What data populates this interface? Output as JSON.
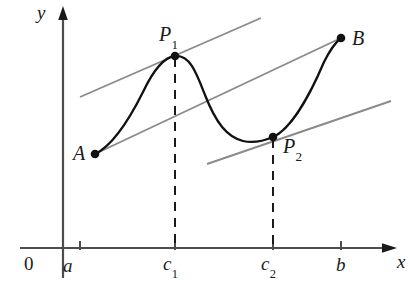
{
  "figure": {
    "axes": {
      "x_label": "x",
      "y_label": "y",
      "origin_label": "0",
      "x_axis_color": "#4d4d4d",
      "y_axis_color": "#4d4d4d"
    },
    "x_ticks": [
      {
        "name": "a",
        "label": "a",
        "sub": "",
        "x": 80
      },
      {
        "name": "c1",
        "label": "c",
        "sub": "1",
        "x": 175
      },
      {
        "name": "c2",
        "label": "c",
        "sub": "2",
        "x": 273
      },
      {
        "name": "b",
        "label": "b",
        "sub": "",
        "x": 341
      }
    ],
    "points": [
      {
        "name": "A",
        "label": "A",
        "sub": "",
        "x": 95,
        "y": 154
      },
      {
        "name": "P1",
        "label": "P",
        "sub": "1",
        "x": 175,
        "y": 56
      },
      {
        "name": "P2",
        "label": "P",
        "sub": "2",
        "x": 273,
        "y": 137
      },
      {
        "name": "B",
        "label": "B",
        "sub": "",
        "x": 341,
        "y": 38
      }
    ],
    "curve": {
      "description": "smooth curve from A rising to local maximum P1, falling to local minimum P2, then rising to B",
      "color": "#111111",
      "stroke_width": 2.2
    },
    "lines": [
      {
        "name": "tangent-at-P1",
        "style": "solid",
        "color": "#8a8a8a",
        "x1": 80,
        "y1": 97,
        "x2": 261,
        "y2": 18
      },
      {
        "name": "secant-A-to-B",
        "style": "solid",
        "color": "#8a8a8a",
        "x1": 95,
        "y1": 154,
        "x2": 341,
        "y2": 38
      },
      {
        "name": "tangent-at-P2",
        "style": "solid",
        "color": "#8a8a8a",
        "x1": 207,
        "y1": 164,
        "x2": 391,
        "y2": 101
      }
    ],
    "dashed_lines": [
      {
        "name": "dashed-c1",
        "x": 175,
        "y_top": 58,
        "y_bottom": 248,
        "color": "#1a1a1a"
      },
      {
        "name": "dashed-c2",
        "x": 273,
        "y_top": 139,
        "y_bottom": 248,
        "color": "#1a1a1a"
      }
    ],
    "colors": {
      "background": "#ffffff",
      "ink": "#111111",
      "gray_line": "#8a8a8a",
      "axis": "#4d4d4d"
    }
  }
}
